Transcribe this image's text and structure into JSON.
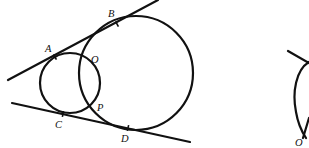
{
  "figure_left": {
    "description": "Two intersecting circles with two common external tangent lines",
    "circles": [
      {
        "name": "small-circle",
        "cx": 70,
        "cy": 83,
        "r": 30
      },
      {
        "name": "large-circle",
        "cx": 136,
        "cy": 73,
        "r": 57
      }
    ],
    "lines": [
      {
        "name": "upper-tangent",
        "x1": 8,
        "y1": 80,
        "x2": 158,
        "y2": 0
      },
      {
        "name": "lower-tangent",
        "x1": 12,
        "y1": 103,
        "x2": 190,
        "y2": 142
      }
    ],
    "tangent_points": [
      {
        "name": "A",
        "x": 55,
        "y": 57
      },
      {
        "name": "B",
        "x": 117,
        "y": 24
      },
      {
        "name": "C",
        "x": 63,
        "y": 114
      },
      {
        "name": "D",
        "x": 128,
        "y": 128
      }
    ],
    "labels": [
      {
        "text": "A",
        "x": 45,
        "y": 52
      },
      {
        "text": "B",
        "x": 108,
        "y": 17
      },
      {
        "text": "O",
        "x": 91,
        "y": 63
      },
      {
        "text": "P",
        "x": 97,
        "y": 111
      },
      {
        "text": "C",
        "x": 55,
        "y": 128
      },
      {
        "text": "D",
        "x": 121,
        "y": 142
      }
    ]
  },
  "figure_right": {
    "description": "Partially visible second figure clipped at right edge",
    "line": {
      "x1": 288,
      "y1": 51,
      "x2": 309,
      "y2": 63
    },
    "labels": [
      {
        "text": "O",
        "x": 295,
        "y": 146
      }
    ]
  },
  "colors": {
    "stroke": "#111111",
    "background": "#ffffff"
  }
}
